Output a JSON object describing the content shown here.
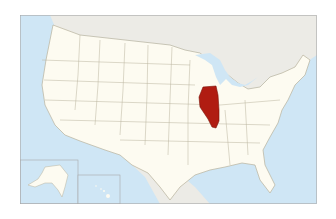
{
  "map": {
    "subject": "United States locator map",
    "highlighted_state": "Illinois",
    "colors": {
      "ocean": "#cfe6f5",
      "land": "#fdfbf1",
      "foreign_land": "#ecebe6",
      "border": "#b8b29c",
      "highlight": "#b01c12",
      "frame": "#a9a9a9"
    },
    "insets": [
      "Alaska",
      "Hawaii"
    ]
  }
}
